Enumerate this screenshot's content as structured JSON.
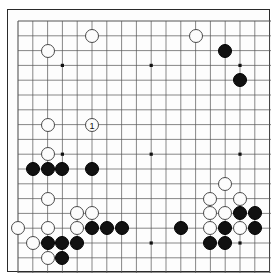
{
  "board": {
    "title": "Go board diagram",
    "size": 19,
    "grid_origin_x": 18,
    "grid_origin_y": 21,
    "grid_spacing": 14.8,
    "line_color": "#555555",
    "border_color": "#2a2a2a",
    "background_color": "#fdfdfd",
    "black_color": "#111111",
    "white_color": "#fcfcfc",
    "star_points": [
      {
        "col": 3,
        "row": 3
      },
      {
        "col": 9,
        "row": 3
      },
      {
        "col": 15,
        "row": 3
      },
      {
        "col": 3,
        "row": 9
      },
      {
        "col": 9,
        "row": 9
      },
      {
        "col": 15,
        "row": 9
      },
      {
        "col": 3,
        "row": 15
      },
      {
        "col": 9,
        "row": 15
      },
      {
        "col": 15,
        "row": 15
      }
    ],
    "stones": [
      {
        "col": 2,
        "row": 2,
        "color": "white",
        "label": ""
      },
      {
        "col": 5,
        "row": 1,
        "color": "white",
        "label": ""
      },
      {
        "col": 12,
        "row": 1,
        "color": "white",
        "label": ""
      },
      {
        "col": 14,
        "row": 2,
        "color": "black",
        "label": ""
      },
      {
        "col": 15,
        "row": 4,
        "color": "black",
        "label": ""
      },
      {
        "col": 2,
        "row": 7,
        "color": "white",
        "label": ""
      },
      {
        "col": 5,
        "row": 7,
        "color": "white",
        "label": "1"
      },
      {
        "col": 2,
        "row": 9,
        "color": "white",
        "label": ""
      },
      {
        "col": 1,
        "row": 10,
        "color": "black",
        "label": ""
      },
      {
        "col": 2,
        "row": 10,
        "color": "black",
        "label": ""
      },
      {
        "col": 3,
        "row": 10,
        "color": "black",
        "label": ""
      },
      {
        "col": 5,
        "row": 10,
        "color": "black",
        "label": ""
      },
      {
        "col": 2,
        "row": 12,
        "color": "white",
        "label": ""
      },
      {
        "col": 4,
        "row": 13,
        "color": "white",
        "label": ""
      },
      {
        "col": 5,
        "row": 13,
        "color": "white",
        "label": ""
      },
      {
        "col": 0,
        "row": 14,
        "color": "white",
        "label": ""
      },
      {
        "col": 2,
        "row": 14,
        "color": "white",
        "label": ""
      },
      {
        "col": 4,
        "row": 14,
        "color": "white",
        "label": ""
      },
      {
        "col": 5,
        "row": 14,
        "color": "black",
        "label": ""
      },
      {
        "col": 6,
        "row": 14,
        "color": "black",
        "label": ""
      },
      {
        "col": 7,
        "row": 14,
        "color": "black",
        "label": ""
      },
      {
        "col": 1,
        "row": 15,
        "color": "white",
        "label": ""
      },
      {
        "col": 2,
        "row": 15,
        "color": "black",
        "label": ""
      },
      {
        "col": 3,
        "row": 15,
        "color": "black",
        "label": ""
      },
      {
        "col": 4,
        "row": 15,
        "color": "black",
        "label": ""
      },
      {
        "col": 2,
        "row": 16,
        "color": "white",
        "label": ""
      },
      {
        "col": 3,
        "row": 16,
        "color": "black",
        "label": ""
      },
      {
        "col": 11,
        "row": 14,
        "color": "black",
        "label": ""
      },
      {
        "col": 14,
        "row": 11,
        "color": "white",
        "label": ""
      },
      {
        "col": 13,
        "row": 12,
        "color": "white",
        "label": ""
      },
      {
        "col": 15,
        "row": 12,
        "color": "white",
        "label": ""
      },
      {
        "col": 13,
        "row": 13,
        "color": "white",
        "label": ""
      },
      {
        "col": 14,
        "row": 13,
        "color": "white",
        "label": ""
      },
      {
        "col": 15,
        "row": 13,
        "color": "black",
        "label": ""
      },
      {
        "col": 16,
        "row": 13,
        "color": "black",
        "label": ""
      },
      {
        "col": 13,
        "row": 14,
        "color": "white",
        "label": ""
      },
      {
        "col": 14,
        "row": 14,
        "color": "black",
        "label": ""
      },
      {
        "col": 15,
        "row": 14,
        "color": "white",
        "label": ""
      },
      {
        "col": 16,
        "row": 14,
        "color": "black",
        "label": ""
      },
      {
        "col": 13,
        "row": 15,
        "color": "black",
        "label": ""
      },
      {
        "col": 14,
        "row": 15,
        "color": "black",
        "label": ""
      }
    ]
  }
}
